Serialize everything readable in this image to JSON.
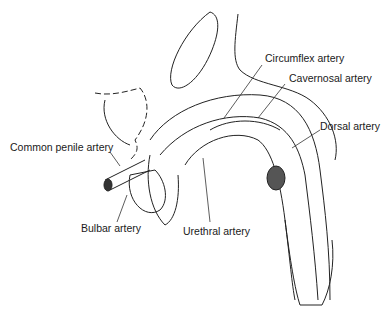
{
  "diagram": {
    "type": "anatomical-illustration",
    "labels": {
      "circumflex": "Circumflex artery",
      "cavernosal": "Cavernosal artery",
      "dorsal": "Dorsal artery",
      "common_penile": "Common penile artery",
      "bulbar": "Bulbar artery",
      "urethral": "Urethral artery"
    }
  }
}
